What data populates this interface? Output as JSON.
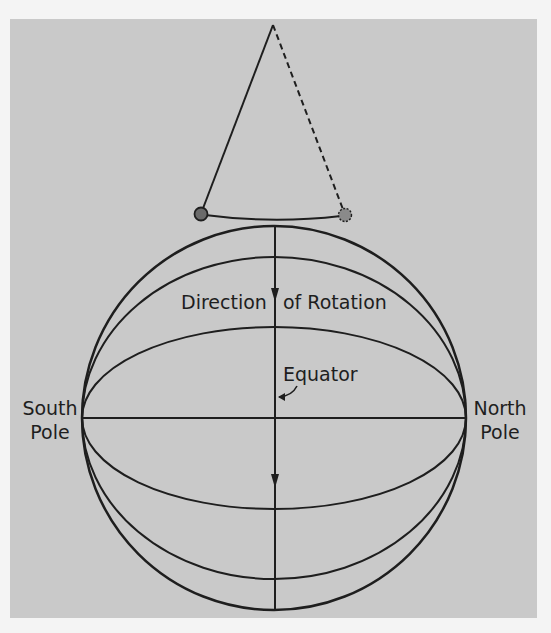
{
  "figure": {
    "colors": {
      "background": "#c9c9c9",
      "outer_border": "#f4f4f4",
      "ink": "#1e1e1e"
    }
  },
  "labels": {
    "direction_left": "Direction",
    "direction_right": "of Rotation",
    "equator": "Equator",
    "south_pole_line1": "South",
    "south_pole_line2": "Pole",
    "north_pole_line1": "North",
    "north_pole_line2": "Pole"
  },
  "pendulum": {
    "pivot": [
      273,
      25
    ],
    "bob_left": [
      201,
      214
    ],
    "bob_right": [
      345,
      215
    ],
    "string_left_style": "solid",
    "string_right_style": "dashed"
  },
  "sphere": {
    "center": [
      274,
      418
    ],
    "radius": 192,
    "meridian_ellipses_ry": [
      161,
      91
    ],
    "equator_line_y": 418,
    "arrows": [
      "down at y=300",
      "down at y=487"
    ]
  }
}
